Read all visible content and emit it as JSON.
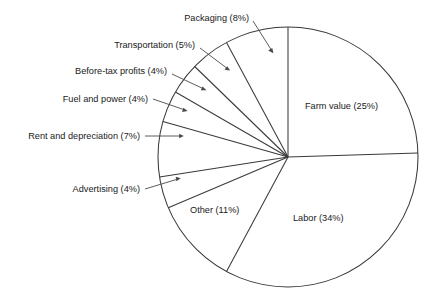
{
  "chart_data": {
    "type": "pie",
    "title": "",
    "subtitle": "",
    "xlabel": "",
    "ylabel": "",
    "legend_position": "none",
    "grid": false,
    "units": "percent",
    "start_angle_deg": 0,
    "direction": "clockwise",
    "center": {
      "x": 288,
      "y": 157
    },
    "radius": 130,
    "categories": [
      "Farm value",
      "Labor",
      "Other",
      "Advertising",
      "Rent and depreciation",
      "Fuel and power",
      "Before-tax profits",
      "Transportation",
      "Packaging"
    ],
    "values": [
      25,
      34,
      11,
      4,
      7,
      4,
      4,
      5,
      8
    ],
    "slices": [
      {
        "name": "Farm value",
        "value": 25,
        "label": "Farm value (25%)",
        "label_placement": "inside",
        "label_x": 305,
        "label_y": 106
      },
      {
        "name": "Labor",
        "value": 34,
        "label": "Labor (34%)",
        "label_placement": "inside",
        "label_x": 293,
        "label_y": 218
      },
      {
        "name": "Other",
        "value": 11,
        "label": "Other (11%)",
        "label_placement": "inside",
        "label_x": 190,
        "label_y": 210
      },
      {
        "name": "Advertising",
        "value": 4,
        "label": "Advertising (4%)",
        "label_placement": "outside-left",
        "label_x": 140,
        "label_y": 192
      },
      {
        "name": "Rent and depreciation",
        "value": 7,
        "label": "Rent and depreciation (7%)",
        "label_placement": "outside-left",
        "label_x": 140,
        "label_y": 139
      },
      {
        "name": "Fuel and power",
        "value": 4,
        "label": "Fuel and power (4%)",
        "label_placement": "outside-left",
        "label_x": 148,
        "label_y": 98
      },
      {
        "name": "Before-tax profits",
        "value": 4,
        "label": "Before-tax profits (4%)",
        "label_placement": "outside-left",
        "label_x": 167,
        "label_y": 70
      },
      {
        "name": "Transportation",
        "value": 5,
        "label": "Transportation (5%)",
        "label_placement": "outside-left",
        "label_x": 195,
        "label_y": 44
      },
      {
        "name": "Packaging",
        "value": 8,
        "label": "Packaging (8%)",
        "label_placement": "outside-top",
        "label_x": 249,
        "label_y": 17
      }
    ]
  },
  "labels": {
    "farm_value": "Farm value (25%)",
    "labor": "Labor (34%)",
    "other": "Other (11%)",
    "advertising": "Advertising (4%)",
    "rent_and_depreciation": "Rent and depreciation (7%)",
    "fuel_and_power": "Fuel and power (4%)",
    "before_tax_profits": "Before-tax profits (4%)",
    "transportation": "Transportation (5%)",
    "packaging": "Packaging (8%)"
  },
  "colors": {
    "background": "#ffffff",
    "stroke": "#3a3a3a",
    "leader": "#4a4a4a",
    "text": "#1a1a1a"
  }
}
